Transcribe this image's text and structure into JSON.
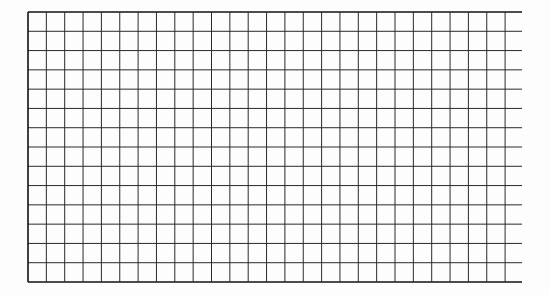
{
  "grid": {
    "left": 28,
    "top": 12,
    "bottom": 282,
    "right_lines_end": 522,
    "columns": 26,
    "col_width": 18.35,
    "rows": 14,
    "row_height": 19.3,
    "line_color": "#2a2a2a",
    "border_color": "#111111"
  }
}
